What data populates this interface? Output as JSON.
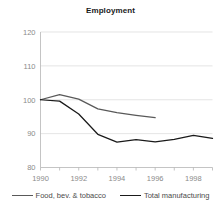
{
  "chart_data": {
    "type": "line",
    "title": "Employment",
    "xlabel": "",
    "ylabel": "",
    "xlim": [
      1990,
      1999
    ],
    "ylim": [
      80,
      120
    ],
    "ytick_values": [
      80,
      90,
      100,
      110,
      120
    ],
    "ytick_labels": [
      "80",
      "90",
      "100",
      "110",
      "120"
    ],
    "xtick_values": [
      1990,
      1992,
      1994,
      1996,
      1998
    ],
    "xtick_labels": [
      "1990",
      "1992",
      "1994",
      "1996",
      "1998"
    ],
    "x_minor_ticks": [
      1990,
      1991,
      1992,
      1993,
      1994,
      1995,
      1996,
      1997,
      1998,
      1999
    ],
    "grid": "horizontal",
    "legend_position": "bottom",
    "series": [
      {
        "name": "Food, bev. & tobacco",
        "color": "#595959",
        "x": [
          1990,
          1991,
          1992,
          1993,
          1994,
          1995,
          1996
        ],
        "values": [
          100.0,
          101.5,
          100.2,
          97.3,
          96.2,
          95.4,
          94.7
        ]
      },
      {
        "name": "Total manufacturing",
        "color": "#1a1a1a",
        "x": [
          1990,
          1991,
          1992,
          1993,
          1994,
          1995,
          1996,
          1997,
          1998,
          1999
        ],
        "values": [
          100.0,
          99.6,
          95.8,
          89.8,
          87.5,
          88.2,
          87.6,
          88.3,
          89.5,
          88.6
        ]
      }
    ]
  },
  "legend": {
    "entries": [
      {
        "label": "Food, bev. & tobacco",
        "color": "#595959"
      },
      {
        "label": "Total manufacturing",
        "color": "#1a1a1a"
      }
    ]
  }
}
